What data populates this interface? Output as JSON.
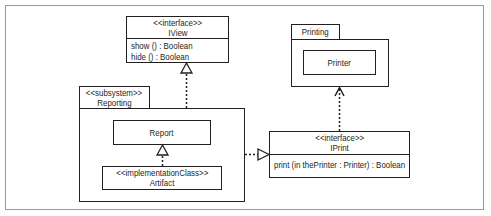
{
  "diagram": {
    "type": "UML component/package diagram",
    "iview": {
      "stereotype": "<<interface>>",
      "name": "IView",
      "operations": [
        "show () : Boolean",
        "hide () : Boolean"
      ]
    },
    "reporting": {
      "stereotype": "<<subsystem>>",
      "name": "Reporting",
      "report": {
        "name": "Report"
      },
      "artifact": {
        "stereotype": "<<implementationClass>>",
        "name": "Artifact"
      }
    },
    "printing": {
      "name": "Printing",
      "printer": {
        "name": "Printer"
      }
    },
    "iprint": {
      "stereotype": "<<interface>>",
      "name": "IPrint",
      "operations": [
        "print (in thePrinter : Printer) : Boolean"
      ]
    },
    "relationships": [
      {
        "from": "Reporting",
        "to": "IView",
        "kind": "realization"
      },
      {
        "from": "Artifact",
        "to": "Report",
        "kind": "realization"
      },
      {
        "from": "Reporting",
        "to": "IPrint",
        "kind": "realization"
      },
      {
        "from": "IPrint",
        "to": "Printing",
        "kind": "dependency"
      }
    ],
    "colors": {
      "line": "#231f20",
      "frame": "#9a9a9a",
      "background": "#ffffff"
    }
  }
}
